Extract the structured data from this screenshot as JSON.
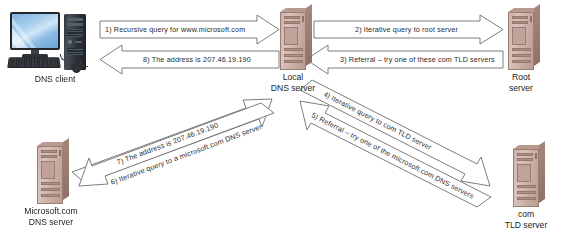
{
  "diagram": {
    "canvas": {
      "width": 575,
      "height": 244
    },
    "stroke_color": "#6e6e6e",
    "server_color": "#c9aea6",
    "screen_color": "#8cbbe4"
  },
  "nodes": [
    {
      "id": "dns-client",
      "label_line1": "DNS client",
      "label_line2": "",
      "type": "desktop-computer"
    },
    {
      "id": "local-dns-server",
      "label_line1": "Local",
      "label_line2": "DNS server",
      "type": "server-tower"
    },
    {
      "id": "root-server",
      "label_line1": "Root",
      "label_line2": "server",
      "type": "server-tower"
    },
    {
      "id": "microsoft-dns-server",
      "label_line1": "Microsoft.com",
      "label_line2": "DNS server",
      "type": "server-tower"
    },
    {
      "id": "com-tld-server",
      "label_line1": "com",
      "label_line2": "TLD server",
      "type": "server-tower"
    }
  ],
  "arrows": [
    {
      "step": 1,
      "text": "1) Recursive query for www.microsoft.com",
      "from": "dns-client",
      "to": "local-dns-server",
      "direction": "right"
    },
    {
      "step": 8,
      "text": "8) The address is 207.46.19.190",
      "from": "local-dns-server",
      "to": "dns-client",
      "direction": "left"
    },
    {
      "step": 2,
      "text": "2) Iterative query to root server",
      "from": "local-dns-server",
      "to": "root-server",
      "direction": "right"
    },
    {
      "step": 3,
      "text": "3) Referral – try one of these com TLD servers",
      "from": "root-server",
      "to": "local-dns-server",
      "direction": "left"
    },
    {
      "step": 4,
      "text": "4) Iterative query to com TLD server",
      "from": "local-dns-server",
      "to": "com-tld-server",
      "direction": "down-right"
    },
    {
      "step": 5,
      "text": "5) Referral – try one of the microsoft.com DNS servers",
      "from": "com-tld-server",
      "to": "local-dns-server",
      "direction": "up-left"
    },
    {
      "step": 6,
      "text": "6) Iterative query to a microsoft.com DNS server",
      "from": "local-dns-server",
      "to": "microsoft-dns-server",
      "direction": "down-left"
    },
    {
      "step": 7,
      "text": "7) The address is 207.46.19.190",
      "from": "microsoft-dns-server",
      "to": "local-dns-server",
      "direction": "up-right"
    }
  ]
}
